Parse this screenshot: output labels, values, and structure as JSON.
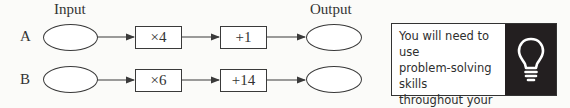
{
  "diagram": {
    "column_labels": {
      "input": "Input",
      "output": "Output"
    },
    "rows": [
      {
        "label": "A",
        "operations": [
          "×4",
          "+1"
        ]
      },
      {
        "label": "B",
        "operations": [
          "×6",
          "+14"
        ]
      }
    ]
  },
  "callout": {
    "line1": "You will need to use",
    "line2": "problem-solving skills",
    "line3": "throughout your exam",
    "line4_dash": "– ",
    "line4_bold": "be prepared!",
    "icon": "lightbulb-icon"
  },
  "colors": {
    "line": "#3a3a3a",
    "icon_panel": "#231f20",
    "icon_stroke": "#ffffff"
  }
}
